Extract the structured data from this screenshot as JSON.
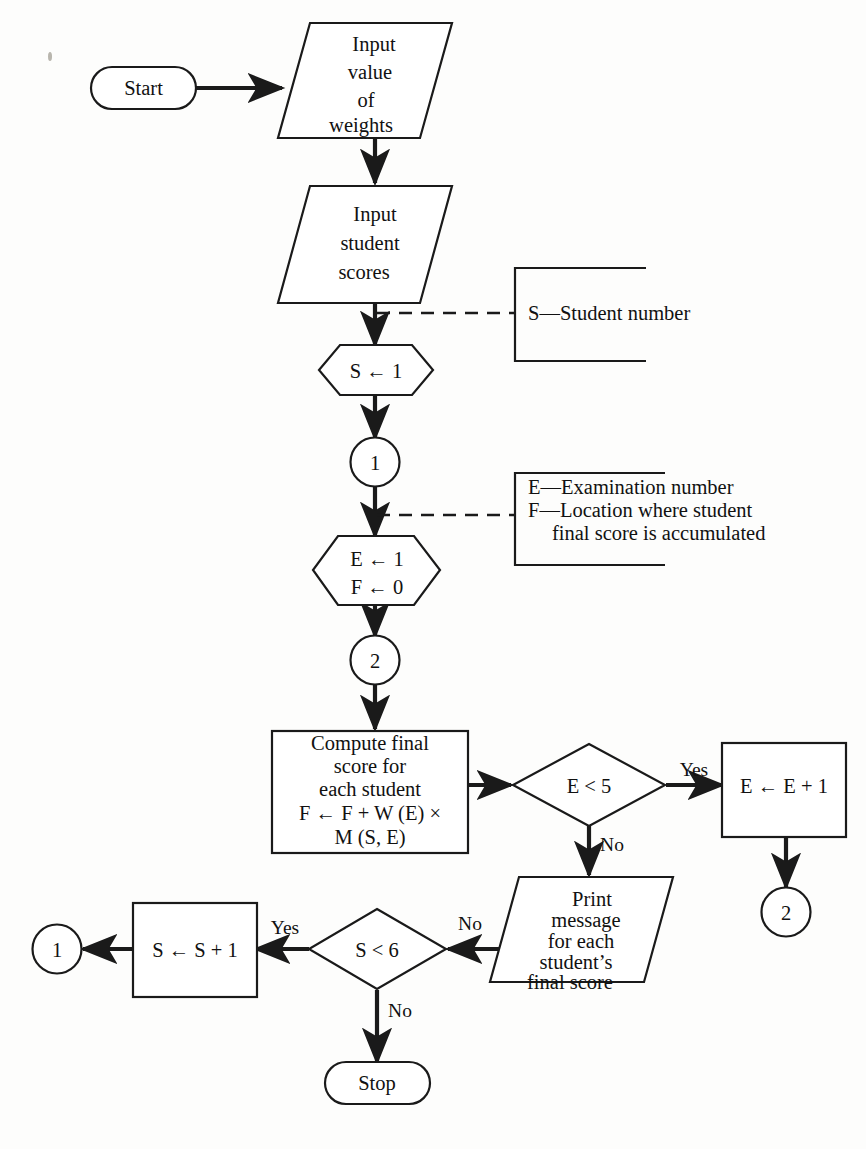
{
  "diagram": {
    "colors": {
      "stroke": "#1a1a1a",
      "fill": "#ffffff",
      "background": "#fdfdfc"
    },
    "nodes": {
      "start": {
        "shape": "terminal",
        "label": "Start"
      },
      "input_weights": {
        "shape": "parallelogram",
        "lines": [
          "Input",
          "value",
          "of",
          "weights"
        ]
      },
      "input_scores": {
        "shape": "parallelogram",
        "lines": [
          "Input",
          "student",
          "scores"
        ]
      },
      "set_s": {
        "shape": "hexagon",
        "lines": [
          "S ← 1"
        ]
      },
      "connector_1_top": {
        "shape": "circle",
        "label": "1"
      },
      "set_e_f": {
        "shape": "hexagon",
        "lines": [
          "E ← 1",
          "F ← 0"
        ]
      },
      "connector_2_top": {
        "shape": "circle",
        "label": "2"
      },
      "compute": {
        "shape": "process",
        "lines": [
          "Compute final",
          "score for",
          "each student",
          "F ← F + W (E) ×",
          "M (S, E)"
        ]
      },
      "decision_e": {
        "shape": "diamond",
        "label": "E < 5"
      },
      "increment_e": {
        "shape": "process",
        "lines": [
          "E ← E + 1"
        ]
      },
      "connector_2_bottom": {
        "shape": "circle",
        "label": "2"
      },
      "print": {
        "shape": "parallelogram",
        "lines": [
          "Print",
          "message",
          "for each",
          "student’s",
          "final score"
        ]
      },
      "decision_s": {
        "shape": "diamond",
        "label": "S < 6"
      },
      "increment_s": {
        "shape": "process",
        "lines": [
          "S ← S + 1"
        ]
      },
      "connector_1_bottom": {
        "shape": "circle",
        "label": "1"
      },
      "stop": {
        "shape": "terminal",
        "label": "Stop"
      }
    },
    "edge_labels": {
      "e_yes": "Yes",
      "e_no": "No",
      "s_yes": "Yes",
      "s_no": "No"
    },
    "annotations": {
      "note_s": {
        "lines": [
          "S—Student number"
        ]
      },
      "note_ef": {
        "lines": [
          "E—Examination number",
          "F—Location where student",
          "final score is accumulated"
        ]
      }
    }
  }
}
